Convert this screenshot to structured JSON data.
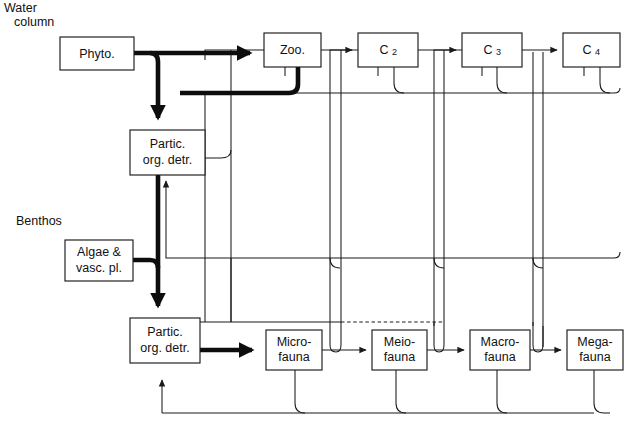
{
  "figure": {
    "background_color": "#ffffff",
    "line_color": "#1a1a1a",
    "box_fill": "#ffffff"
  },
  "zone_labels": [
    {
      "id": "water-column",
      "line1": "Water",
      "line2": "column",
      "x": 4,
      "y": 12
    },
    {
      "id": "benthos",
      "line1": "Benthos",
      "line2": "",
      "x": 16,
      "y": 221
    }
  ],
  "boxes": [
    {
      "id": "phyto",
      "line1": "Phyto.",
      "line2": "",
      "sub": "",
      "x": 60,
      "y": 37,
      "w": 74,
      "h": 33
    },
    {
      "id": "zoo",
      "line1": "Zoo.",
      "line2": "",
      "sub": "",
      "x": 264,
      "y": 33,
      "w": 57,
      "h": 34
    },
    {
      "id": "c2",
      "line1": "C",
      "line2": "",
      "sub": "2",
      "x": 358,
      "y": 33,
      "w": 60,
      "h": 34
    },
    {
      "id": "c3",
      "line1": "C",
      "line2": "",
      "sub": "3",
      "x": 462,
      "y": 33,
      "w": 60,
      "h": 34
    },
    {
      "id": "c4",
      "line1": "C",
      "line2": "",
      "sub": "4",
      "x": 563,
      "y": 33,
      "w": 57,
      "h": 34
    },
    {
      "id": "pod-pelagic",
      "line1": "Partic.",
      "line2": "org. detr.",
      "sub": "",
      "x": 130,
      "y": 130,
      "w": 75,
      "h": 45
    },
    {
      "id": "algae",
      "line1": "Algae &",
      "line2": "vasc. pl.",
      "sub": "",
      "x": 65,
      "y": 240,
      "w": 68,
      "h": 41
    },
    {
      "id": "pod-benthic",
      "line1": "Partic.",
      "line2": "org. detr.",
      "sub": "",
      "x": 130,
      "y": 318,
      "w": 70,
      "h": 45
    },
    {
      "id": "microfauna",
      "line1": "Micro-",
      "line2": "fauna",
      "sub": "",
      "x": 266,
      "y": 330,
      "w": 56,
      "h": 40
    },
    {
      "id": "meiofauna",
      "line1": "Meio-",
      "line2": "fauna",
      "sub": "",
      "x": 372,
      "y": 330,
      "w": 55,
      "h": 40
    },
    {
      "id": "macrofauna",
      "line1": "Macro-",
      "line2": "fauna",
      "sub": "",
      "x": 470,
      "y": 330,
      "w": 60,
      "h": 40
    },
    {
      "id": "megafauna",
      "line1": "Mega-",
      "line2": "fauna",
      "sub": "",
      "x": 567,
      "y": 330,
      "w": 56,
      "h": 40
    }
  ],
  "flows": {
    "thick_description": "Major carbon flows (bold): phytoplankton to zooplankton, phytoplankton to pelagic particulate organic detritus, zooplankton return to detritus, pelagic detritus to benthic detritus, algae and vascular plants to benthic detritus, benthic detritus to microfauna",
    "thin_description": "Minor flows (light): consumer trophic transfers C2-C4, consumer returns to detritus pools, benthic fauna transfers and returns",
    "dotted_description": "Dotted flow from pelagic consumers down to benthic meiofauna level"
  },
  "legend_note": ""
}
